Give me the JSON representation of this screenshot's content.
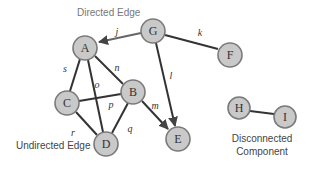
{
  "diagram": {
    "type": "graph",
    "nodes": [
      {
        "id": "A",
        "label": "A",
        "x": 85,
        "y": 48
      },
      {
        "id": "G",
        "label": "G",
        "x": 153,
        "y": 31
      },
      {
        "id": "F",
        "label": "F",
        "x": 230,
        "y": 52
      },
      {
        "id": "B",
        "label": "B",
        "x": 133,
        "y": 92
      },
      {
        "id": "C",
        "label": "C",
        "x": 67,
        "y": 103
      },
      {
        "id": "D",
        "label": "D",
        "x": 106,
        "y": 144
      },
      {
        "id": "E",
        "label": "E",
        "x": 178,
        "y": 140
      },
      {
        "id": "H",
        "label": "H",
        "x": 239,
        "y": 108
      },
      {
        "id": "I",
        "label": "I",
        "x": 285,
        "y": 117
      }
    ],
    "edges": [
      {
        "label": "j",
        "from": "G",
        "to": "A",
        "directed": true
      },
      {
        "label": "k",
        "from": "G",
        "to": "F",
        "directed": false
      },
      {
        "label": "l",
        "from": "G",
        "to": "E",
        "directed": true
      },
      {
        "label": "s",
        "from": "A",
        "to": "C",
        "directed": false
      },
      {
        "label": "n",
        "from": "A",
        "to": "B",
        "directed": false
      },
      {
        "label": "o",
        "from": "A",
        "to": "D",
        "directed": false
      },
      {
        "label": "p",
        "from": "C",
        "to": "B",
        "directed": false
      },
      {
        "label": "m",
        "from": "B",
        "to": "E",
        "directed": true
      },
      {
        "label": "q",
        "from": "B",
        "to": "D",
        "directed": false
      },
      {
        "label": "r",
        "from": "C",
        "to": "D",
        "directed": false
      },
      {
        "label": "",
        "from": "H",
        "to": "I",
        "directed": false
      }
    ],
    "annotations": {
      "directed_edge": "Directed Edge",
      "undirected_edge": "Undirected Edge",
      "disconnected_line1": "Disconnected",
      "disconnected_line2": "Component"
    }
  }
}
